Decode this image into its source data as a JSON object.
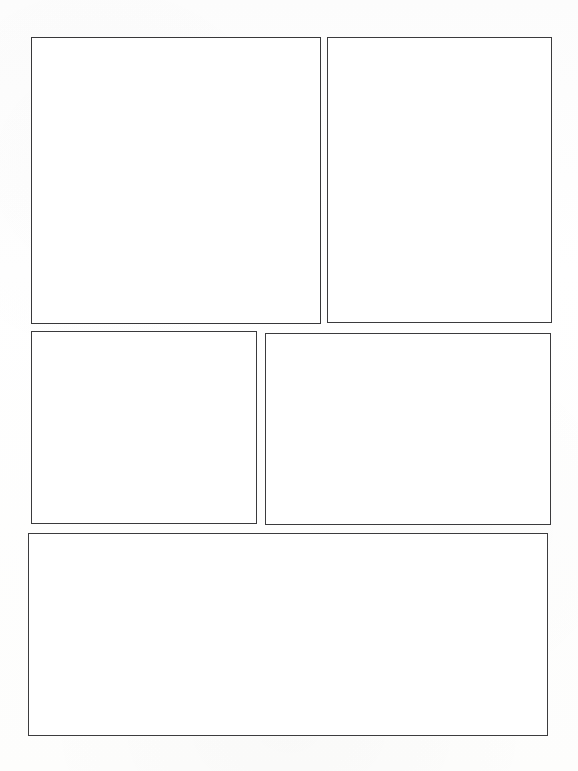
{
  "page": {
    "width": 578,
    "height": 771,
    "background_color": "#ffffff",
    "line_color": "#3a3a3c",
    "line_width_px": 1.6,
    "panel_count": 5,
    "margin": {
      "top": 37,
      "left": 28,
      "right": 26,
      "bottom": 35
    },
    "gutter": {
      "horizontal": 7,
      "vertical": 8
    }
  },
  "panels": [
    {
      "id": "panel-1",
      "label": "",
      "row": 1,
      "column": 1,
      "x": 31,
      "y": 37,
      "width": 290,
      "height": 287,
      "content": ""
    },
    {
      "id": "panel-2",
      "label": "",
      "row": 1,
      "column": 2,
      "x": 327,
      "y": 37,
      "width": 225,
      "height": 286,
      "content": ""
    },
    {
      "id": "panel-3",
      "label": "",
      "row": 2,
      "column": 1,
      "x": 31,
      "y": 331,
      "width": 226,
      "height": 193,
      "content": ""
    },
    {
      "id": "panel-4",
      "label": "",
      "row": 2,
      "column": 2,
      "x": 265,
      "y": 333,
      "width": 286,
      "height": 192,
      "content": ""
    },
    {
      "id": "panel-5",
      "label": "",
      "row": 3,
      "column": 1,
      "x": 28,
      "y": 533,
      "width": 520,
      "height": 203,
      "content": ""
    }
  ]
}
